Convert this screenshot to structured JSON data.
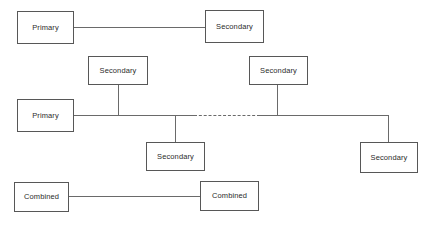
{
  "diagram": {
    "canvas": {
      "width": 432,
      "height": 225,
      "background": "#ffffff"
    },
    "style": {
      "node_border_color": "#575757",
      "node_fill_color": "#ffffff",
      "edge_color": "#6a6a6a",
      "label_color": "#2b2b2b"
    },
    "nodes": [
      {
        "id": "primary-top",
        "label": "Primary",
        "x": 17,
        "y": 11,
        "w": 57,
        "h": 33
      },
      {
        "id": "secondary-top",
        "label": "Secondary",
        "x": 205,
        "y": 10,
        "w": 59,
        "h": 33
      },
      {
        "id": "secondary-mid-left",
        "label": "Secondary",
        "x": 88,
        "y": 56,
        "w": 60,
        "h": 29
      },
      {
        "id": "secondary-mid-right",
        "label": "Secondary",
        "x": 249,
        "y": 56,
        "w": 59,
        "h": 29
      },
      {
        "id": "primary-middle",
        "label": "Primary",
        "x": 17,
        "y": 99,
        "w": 57,
        "h": 33
      },
      {
        "id": "secondary-lower",
        "label": "Secondary",
        "x": 146,
        "y": 142,
        "w": 59,
        "h": 29
      },
      {
        "id": "secondary-right",
        "label": "Secondary",
        "x": 360,
        "y": 142,
        "w": 58,
        "h": 31
      },
      {
        "id": "combined-left",
        "label": "Combined",
        "x": 14,
        "y": 182,
        "w": 55,
        "h": 30
      },
      {
        "id": "combined-right",
        "label": "Combined",
        "x": 200,
        "y": 181,
        "w": 59,
        "h": 30
      }
    ],
    "edges": [
      {
        "id": "edge-primary-top-to-secondary-top",
        "kind": "solid-horizontal",
        "x": 74,
        "y": 27,
        "length": 131
      },
      {
        "id": "edge-trunk-left",
        "kind": "solid-horizontal",
        "x": 74,
        "y": 115,
        "length": 121
      },
      {
        "id": "edge-trunk-dashed",
        "kind": "dashed-horizontal",
        "x": 194,
        "y": 115,
        "length": 66
      },
      {
        "id": "edge-trunk-right",
        "kind": "solid-horizontal",
        "x": 259,
        "y": 115,
        "length": 130
      },
      {
        "id": "edge-riser-mid-left",
        "kind": "solid-vertical",
        "x": 118,
        "y": 85,
        "length": 31
      },
      {
        "id": "edge-riser-mid-right",
        "kind": "solid-vertical",
        "x": 277,
        "y": 85,
        "length": 31
      },
      {
        "id": "edge-drop-lower-secondary",
        "kind": "solid-vertical",
        "x": 175,
        "y": 115,
        "length": 28
      },
      {
        "id": "edge-drop-right-secondary",
        "kind": "solid-vertical",
        "x": 388,
        "y": 115,
        "length": 28
      },
      {
        "id": "edge-combined-to-combined",
        "kind": "solid-horizontal",
        "x": 69,
        "y": 196,
        "length": 131
      }
    ]
  }
}
